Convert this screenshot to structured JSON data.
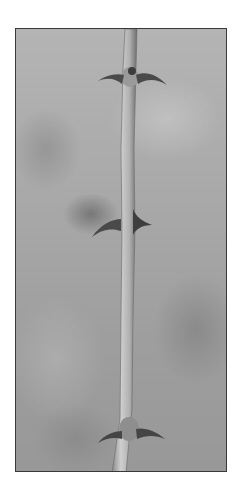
{
  "image": {
    "subject": "thorny-stem",
    "description": "Black and white photograph of a slender plant stem with three pairs of curved thorns against a blurred gray background",
    "thorn_pairs": 3,
    "colors": {
      "frame_border": "#3a3a3a",
      "background": "#ffffff",
      "stem": "#b8b8b8",
      "thorn": "#4a4a4a"
    }
  }
}
